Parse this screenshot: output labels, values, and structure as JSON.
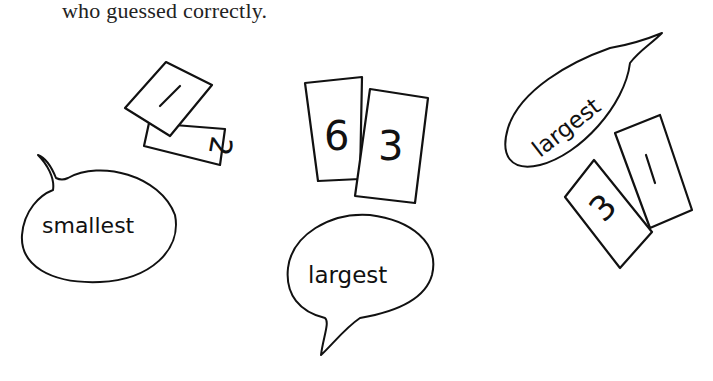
{
  "caption": "who guessed correctly.",
  "groups": [
    {
      "id": "left",
      "cards": [
        {
          "value": "2"
        },
        {
          "value": "1"
        }
      ],
      "bubble": {
        "label": "smallest"
      }
    },
    {
      "id": "middle",
      "cards": [
        {
          "value": "6"
        },
        {
          "value": "3"
        }
      ],
      "bubble": {
        "label": "largest"
      }
    },
    {
      "id": "right",
      "cards": [
        {
          "value": "3"
        },
        {
          "value": "1"
        }
      ],
      "bubble": {
        "label": "largest"
      }
    }
  ],
  "colors": {
    "ink": "#111111",
    "paper": "#ffffff"
  }
}
